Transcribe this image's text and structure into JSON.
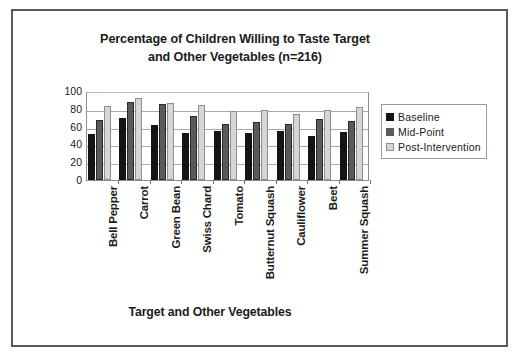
{
  "chart_data": {
    "type": "bar",
    "title": "Percentage of Children Willing to Taste Target and Other Vegetables (n=216)",
    "title_line1": "Percentage of Children Willing to Taste Target",
    "title_line2": "and Other Vegetables (n=216)",
    "xlabel": "Target and Other Vegetables",
    "ylabel": "",
    "ylim": [
      0,
      100
    ],
    "ytick_labels": [
      "100",
      "80",
      "60",
      "40",
      "20",
      "0"
    ],
    "ytick_values": [
      100,
      80,
      60,
      40,
      20,
      0
    ],
    "grid": true,
    "legend_position": "right",
    "categories": [
      "Bell Pepper",
      "Carrot",
      "Green Bean",
      "Swiss Chard",
      "Tomato",
      "Butternut Squash",
      "Cauliflower",
      "Beet",
      "Summer Squash"
    ],
    "series": [
      {
        "name": "Baseline",
        "color": "#141414",
        "values": [
          52,
          70,
          62,
          53,
          55,
          53,
          55,
          50,
          54
        ]
      },
      {
        "name": "Mid-Point",
        "color": "#5a5a5c",
        "values": [
          67,
          88,
          85,
          72,
          63,
          65,
          63,
          68,
          66
        ]
      },
      {
        "name": "Post-Intervention",
        "color": "#d6d6d6",
        "values": [
          83,
          92,
          86,
          84,
          78,
          79,
          74,
          79,
          82
        ]
      }
    ]
  },
  "legend": {
    "items": [
      {
        "label": "Baseline",
        "swatch": "#141414"
      },
      {
        "label": "Mid-Point",
        "swatch": "#5a5a5c"
      },
      {
        "label": "Post-Intervention",
        "swatch": "#d6d6d6"
      }
    ]
  },
  "colors": {
    "baseline": "#141414",
    "midpoint": "#5a5a5c",
    "postintervention": "#d6d6d6",
    "frame": "#59595b",
    "text": "#1b1b1b",
    "gridline": "#a9a9ab"
  }
}
